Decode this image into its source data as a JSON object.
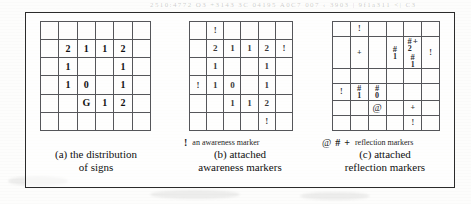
{
  "page": {
    "ghost_header_text": "2510:4772      O3 +3143 3C 04195   A0C7  007 ‹ 3903 |    9f1a311    <|  C3"
  },
  "figure": {
    "panels": [
      {
        "id": "a",
        "name": "distribution-of-signs",
        "caption_lines": [
          "(a) the distribution",
          "of signs"
        ],
        "grid": {
          "rows": 6,
          "cols": 6,
          "cells": [
            [
              "",
              "",
              "",
              "",
              "",
              ""
            ],
            [
              "",
              "2",
              "1",
              "1",
              "2",
              ""
            ],
            [
              "",
              "1",
              "",
              "",
              "1",
              ""
            ],
            [
              "",
              "1",
              "0",
              "",
              "1",
              ""
            ],
            [
              "",
              "",
              "G",
              "1",
              "2",
              ""
            ],
            [
              "",
              "",
              "",
              "",
              "",
              ""
            ]
          ]
        },
        "legend": null
      },
      {
        "id": "b",
        "name": "attached-awareness-markers",
        "caption_lines": [
          "(b) attached",
          "awareness markers"
        ],
        "grid": {
          "rows": 6,
          "cols": 6,
          "cells": [
            [
              "",
              "!",
              "",
              "",
              "",
              ""
            ],
            [
              "",
              "2",
              "1",
              "1",
              "2",
              "!"
            ],
            [
              "",
              "1",
              "",
              "",
              "1",
              ""
            ],
            [
              "!",
              "1",
              "0",
              "",
              "1",
              ""
            ],
            [
              "",
              "",
              "1",
              "1",
              "2",
              ""
            ],
            [
              "",
              "",
              "",
              "",
              "!",
              ""
            ]
          ]
        },
        "legend": {
          "symbols": [
            "!"
          ],
          "text": "an awareness marker"
        }
      },
      {
        "id": "c",
        "name": "attached-reflection-markers",
        "caption_lines": [
          "(c) attached",
          "reflection markers"
        ],
        "grid": {
          "rows": 6,
          "cols": 6,
          "cells": [
            [
              {
                "t": "plain",
                "v": ""
              },
              {
                "t": "plain",
                "v": "!"
              },
              {
                "t": "plain",
                "v": ""
              },
              {
                "t": "plain",
                "v": ""
              },
              {
                "t": "plain",
                "v": ""
              },
              {
                "t": "plain",
                "v": ""
              }
            ],
            [
              {
                "t": "plain",
                "v": ""
              },
              {
                "t": "plain",
                "v": "+"
              },
              {
                "t": "plain",
                "v": ""
              },
              {
                "t": "hash",
                "v": "1"
              },
              {
                "t": "hashplus",
                "v": "2",
                "below": "1"
              },
              {
                "t": "plain",
                "v": "!"
              }
            ],
            [
              {
                "t": "plain",
                "v": ""
              },
              {
                "t": "plain",
                "v": ""
              },
              {
                "t": "plain",
                "v": ""
              },
              {
                "t": "plain",
                "v": ""
              },
              {
                "t": "plain",
                "v": ""
              },
              {
                "t": "plain",
                "v": ""
              }
            ],
            [
              {
                "t": "plain",
                "v": "!"
              },
              {
                "t": "hash",
                "v": "1"
              },
              {
                "t": "hash",
                "v": "0"
              },
              {
                "t": "plain",
                "v": ""
              },
              {
                "t": "plain",
                "v": ""
              },
              {
                "t": "plain",
                "v": ""
              }
            ],
            [
              {
                "t": "plain",
                "v": ""
              },
              {
                "t": "plain",
                "v": ""
              },
              {
                "t": "at",
                "v": "@"
              },
              {
                "t": "plain",
                "v": ""
              },
              {
                "t": "plain",
                "v": "+"
              },
              {
                "t": "plain",
                "v": ""
              }
            ],
            [
              {
                "t": "plain",
                "v": ""
              },
              {
                "t": "plain",
                "v": ""
              },
              {
                "t": "plain",
                "v": ""
              },
              {
                "t": "plain",
                "v": ""
              },
              {
                "t": "plain",
                "v": "!"
              },
              {
                "t": "plain",
                "v": ""
              }
            ]
          ]
        },
        "legend": {
          "symbols": [
            "@",
            "#",
            "+"
          ],
          "text": "reflection markers"
        }
      }
    ]
  }
}
